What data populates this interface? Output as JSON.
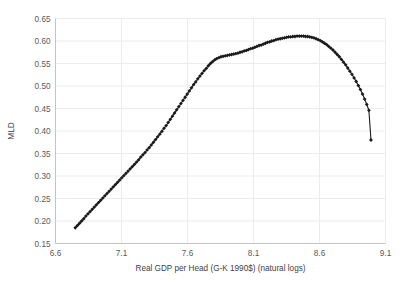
{
  "chart_data": {
    "type": "scatter",
    "title": "",
    "xlabel": "Real GDP per Head (G-K 1990$) (natural logs)",
    "ylabel": "MLD",
    "xlim": [
      6.6,
      9.1
    ],
    "ylim": [
      0.15,
      0.65
    ],
    "xticks": [
      "6.6",
      "7.1",
      "7.6",
      "8.1",
      "8.6",
      "9.1"
    ],
    "xtick_values": [
      6.6,
      7.1,
      7.6,
      8.1,
      8.6,
      9.1
    ],
    "yticks": [
      "0.15",
      "0.20",
      "0.25",
      "0.30",
      "0.35",
      "0.40",
      "0.45",
      "0.50",
      "0.55",
      "0.60",
      "0.65"
    ],
    "ytick_values": [
      0.15,
      0.2,
      0.25,
      0.3,
      0.35,
      0.4,
      0.45,
      0.5,
      0.55,
      0.6,
      0.65
    ],
    "grid": "both-light",
    "legend": "none",
    "marker": "diamond",
    "marker_color": "#1a1a1a",
    "line_color": "#1a1a1a",
    "series": [
      {
        "name": "MLD vs Real GDP per Head",
        "x": [
          6.75,
          6.766,
          6.782,
          6.798,
          6.814,
          6.83,
          6.846,
          6.862,
          6.878,
          6.894,
          6.91,
          6.926,
          6.942,
          6.958,
          6.974,
          6.99,
          7.006,
          7.022,
          7.038,
          7.054,
          7.07,
          7.086,
          7.102,
          7.118,
          7.134,
          7.15,
          7.166,
          7.182,
          7.198,
          7.214,
          7.23,
          7.246,
          7.262,
          7.278,
          7.294,
          7.31,
          7.326,
          7.342,
          7.358,
          7.374,
          7.39,
          7.406,
          7.422,
          7.438,
          7.454,
          7.47,
          7.486,
          7.502,
          7.518,
          7.534,
          7.55,
          7.566,
          7.582,
          7.598,
          7.614,
          7.63,
          7.646,
          7.662,
          7.678,
          7.694,
          7.71,
          7.726,
          7.742,
          7.758,
          7.774,
          7.79,
          7.806,
          7.822,
          7.838,
          7.854,
          7.87,
          7.886,
          7.902,
          7.918,
          7.934,
          7.95,
          7.966,
          7.982,
          7.998,
          8.014,
          8.03,
          8.046,
          8.062,
          8.078,
          8.094,
          8.11,
          8.126,
          8.142,
          8.158,
          8.174,
          8.19,
          8.206,
          8.222,
          8.238,
          8.254,
          8.27,
          8.286,
          8.302,
          8.318,
          8.334,
          8.35,
          8.366,
          8.382,
          8.398,
          8.414,
          8.43,
          8.446,
          8.462,
          8.478,
          8.494,
          8.51,
          8.526,
          8.542,
          8.558,
          8.574,
          8.59,
          8.606,
          8.622,
          8.638,
          8.654,
          8.67,
          8.686,
          8.702,
          8.718,
          8.734,
          8.75,
          8.766,
          8.782,
          8.798,
          8.814,
          8.83,
          8.846,
          8.862,
          8.878,
          8.894,
          8.91,
          8.926,
          8.942,
          8.958,
          8.974,
          8.99
        ],
        "y": [
          0.185,
          0.19,
          0.195,
          0.2,
          0.205,
          0.211,
          0.216,
          0.221,
          0.226,
          0.231,
          0.236,
          0.241,
          0.246,
          0.251,
          0.256,
          0.261,
          0.266,
          0.271,
          0.276,
          0.281,
          0.286,
          0.291,
          0.296,
          0.301,
          0.306,
          0.311,
          0.316,
          0.321,
          0.326,
          0.331,
          0.336,
          0.342,
          0.347,
          0.352,
          0.358,
          0.363,
          0.369,
          0.375,
          0.381,
          0.387,
          0.393,
          0.399,
          0.406,
          0.412,
          0.419,
          0.426,
          0.433,
          0.44,
          0.447,
          0.454,
          0.461,
          0.468,
          0.475,
          0.482,
          0.489,
          0.496,
          0.503,
          0.509,
          0.516,
          0.522,
          0.528,
          0.534,
          0.539,
          0.545,
          0.55,
          0.554,
          0.558,
          0.561,
          0.563,
          0.565,
          0.566,
          0.567,
          0.568,
          0.569,
          0.57,
          0.571,
          0.572,
          0.573,
          0.575,
          0.576,
          0.578,
          0.579,
          0.581,
          0.583,
          0.584,
          0.586,
          0.588,
          0.59,
          0.591,
          0.593,
          0.595,
          0.597,
          0.598,
          0.6,
          0.601,
          0.603,
          0.604,
          0.605,
          0.606,
          0.607,
          0.608,
          0.609,
          0.609,
          0.61,
          0.61,
          0.611,
          0.611,
          0.611,
          0.611,
          0.61,
          0.61,
          0.609,
          0.608,
          0.607,
          0.605,
          0.603,
          0.601,
          0.598,
          0.595,
          0.592,
          0.588,
          0.584,
          0.58,
          0.575,
          0.57,
          0.565,
          0.559,
          0.553,
          0.547,
          0.54,
          0.533,
          0.526,
          0.518,
          0.51,
          0.501,
          0.492,
          0.482,
          0.471,
          0.459,
          0.446,
          0.38
        ]
      }
    ]
  }
}
